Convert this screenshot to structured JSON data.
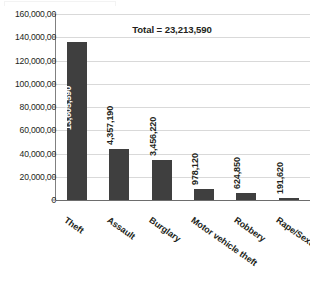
{
  "chart_data": {
    "type": "bar",
    "title": "",
    "subtitle": "",
    "xlabel": "",
    "ylabel": "",
    "categories": [
      "Theft",
      "Assault",
      "Burglary",
      "Motor vehicle theft",
      "Robbery",
      "Rape/Sexual Assault"
    ],
    "values": [
      13605590,
      4357190,
      3456220,
      978120,
      624850,
      191620
    ],
    "value_labels": [
      "13,605,590",
      "4,357,190",
      "3,456,220",
      "978,120",
      "624,850",
      "191,620"
    ],
    "ylim": [
      0,
      16000000
    ],
    "ytick_values": [
      0,
      2000000,
      4000000,
      6000000,
      8000000,
      10000000,
      12000000,
      14000000,
      16000000
    ],
    "ytick_labels": [
      "0",
      "20,000,00",
      "40,000,00",
      "60,000,00",
      "80,000,00",
      "100,000,00",
      "120,000,00",
      "140,000,00",
      "160,000,00"
    ],
    "annotations": [
      {
        "name": "total",
        "text": "Total = 23,213,590"
      }
    ],
    "grid": true,
    "legend": false,
    "legend_position": "none",
    "bar_color": "#3f3f3f",
    "grid_color": "#d9d9d9",
    "axis_color": "#808080",
    "text_color": "#231f20",
    "inside_label_color": "#ffffff"
  },
  "total": {
    "text": "Total = 23,213,590",
    "value": 23213590
  }
}
